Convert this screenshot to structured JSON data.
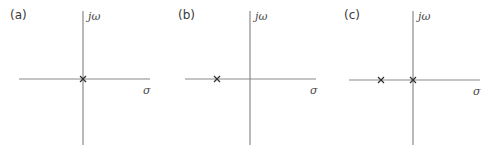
{
  "figure": {
    "panels": [
      {
        "label": "(a)",
        "vertical_axis_label": "jω",
        "horizontal_axis_label": "σ",
        "poles": [
          {
            "sigma": 0,
            "omega": 0,
            "marker": "×"
          }
        ]
      },
      {
        "label": "(b)",
        "vertical_axis_label": "jω",
        "horizontal_axis_label": "σ",
        "poles": [
          {
            "sigma": -1,
            "omega": 0,
            "marker": "×"
          }
        ]
      },
      {
        "label": "(c)",
        "vertical_axis_label": "jω",
        "horizontal_axis_label": "σ",
        "poles": [
          {
            "sigma": -1,
            "omega": 0,
            "marker": "×"
          },
          {
            "sigma": 0,
            "omega": 0,
            "marker": "×"
          }
        ]
      }
    ]
  }
}
